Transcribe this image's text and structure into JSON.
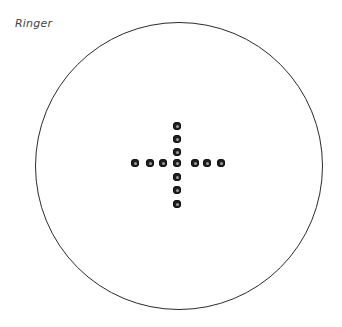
{
  "title": "Ringer",
  "ring": {
    "center_x": 179,
    "center_y": 166,
    "diameter": 288,
    "stroke_color": "#2b2b2b"
  },
  "marbles": {
    "color": "#1e1e1e",
    "diameter": 8,
    "horizontal": [
      {
        "x": 135,
        "y": 163
      },
      {
        "x": 150,
        "y": 163
      },
      {
        "x": 163,
        "y": 163
      },
      {
        "x": 177,
        "y": 163
      },
      {
        "x": 195,
        "y": 163
      },
      {
        "x": 207,
        "y": 163
      },
      {
        "x": 221,
        "y": 163
      }
    ],
    "vertical": [
      {
        "x": 177,
        "y": 126
      },
      {
        "x": 177,
        "y": 139
      },
      {
        "x": 177,
        "y": 152
      },
      {
        "x": 177,
        "y": 177
      },
      {
        "x": 177,
        "y": 190
      },
      {
        "x": 177,
        "y": 204
      }
    ],
    "count": 13
  }
}
